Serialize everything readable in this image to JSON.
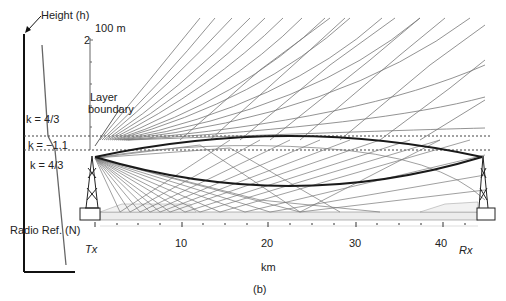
{
  "figure": {
    "caption": "(b)",
    "left_panel": {
      "height_label": "Height (h)",
      "x_axis_label": "Radio Ref. (N)",
      "regions": [
        {
          "label": "k = 4/3",
          "position": "upper"
        },
        {
          "label": "k = −1.1",
          "position": "layer"
        },
        {
          "label": "k = 4/3",
          "position": "lower"
        }
      ]
    },
    "height_scale": {
      "unit_label": "100 m",
      "tick_label": "2"
    },
    "layer_label_line1": "Layer",
    "layer_label_line2": "boundary",
    "x_axis": {
      "label": "km",
      "ticks": [
        "10",
        "20",
        "30",
        "40"
      ],
      "tx_label": "Tx",
      "rx_label": "Rx"
    },
    "colors": {
      "ray": "#6e6e6e",
      "bold_ray": "#1a1a1a",
      "ground": "#e8e8e8"
    }
  }
}
